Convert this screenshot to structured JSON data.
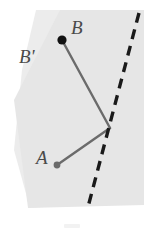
{
  "figure": {
    "type": "geometry-diagram",
    "width": 144,
    "height": 235,
    "background_color": "#ffffff",
    "labels": {
      "point_b": "B",
      "point_b_reflected": "B'",
      "point_a": "A",
      "label_color": "#4a4a4a"
    },
    "colors": {
      "shaded_region": "#ececec",
      "shaded_region_light": "#f4f4f4",
      "segment_stroke": "#6b6b6b",
      "mirror_line_stroke": "#1a1a1a",
      "point_b_fill": "#111111",
      "point_a_fill": "#6b6b6b"
    },
    "points": {
      "b": {
        "x": 62,
        "y": 40,
        "radius": 4.6,
        "filled": true
      },
      "a": {
        "x": 57,
        "y": 165,
        "radius": 3.4,
        "filled": true
      },
      "vertex": {
        "x": 110,
        "y": 128,
        "radius": 0,
        "filled": false
      }
    },
    "segments": [
      {
        "name": "segment-b-to-vertex",
        "x1": 62,
        "y1": 40,
        "x2": 110,
        "y2": 128,
        "stroke_width": 2.4
      },
      {
        "name": "segment-vertex-to-a",
        "x1": 110,
        "y1": 128,
        "x2": 57,
        "y2": 165,
        "stroke_width": 2.4
      }
    ],
    "mirror_line": {
      "name": "dashed-mirror-line",
      "x1": 139,
      "y1": 13,
      "x2": 88,
      "y2": 207,
      "stroke_width": 3.4,
      "dash_length": 10,
      "dash_gap": 7
    },
    "shaded_region": {
      "name": "half-plane-region",
      "polygon": "36,10 144,10 144,200 30,208 14,150 22,70"
    },
    "shaded_region_secondary": {
      "name": "half-plane-region-overlap",
      "polygon": "14,100 60,10 144,10 144,205 28,208"
    }
  }
}
